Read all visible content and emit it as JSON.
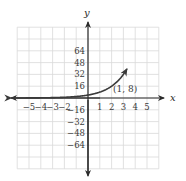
{
  "chart_data": {
    "type": "line",
    "title": "",
    "xlabel": "x",
    "ylabel": "y",
    "xlim": [
      -6,
      6
    ],
    "ylim": [
      -96,
      96
    ],
    "x_ticks": [
      -5,
      -4,
      -3,
      -2,
      1,
      2,
      3,
      4,
      5
    ],
    "x_tick_labels": [
      "−5",
      "−4",
      "−3",
      "−2",
      "1",
      "2",
      "3",
      "4",
      "5"
    ],
    "y_ticks": [
      64,
      48,
      32,
      16,
      -16,
      -32,
      -48,
      -64
    ],
    "y_tick_labels": [
      "64",
      "48",
      "32",
      "16",
      "−16",
      "−32",
      "−48",
      "−64"
    ],
    "grid": true,
    "grid_x_step": 1,
    "grid_y_step": 16,
    "series": [
      {
        "name": "y = 2^(x+2)",
        "x": [
          -6,
          -5,
          -4,
          -3,
          -2,
          -1,
          0,
          1,
          2,
          3,
          3.3
        ],
        "values": [
          0.0625,
          0.125,
          0.25,
          0.5,
          1,
          2,
          4,
          8,
          16,
          32,
          39.4
        ]
      }
    ],
    "annotations": [
      {
        "text": "(1, 8)",
        "x": 1,
        "y": 8
      }
    ],
    "arrows": {
      "left_end": true,
      "right_end": true
    }
  },
  "labels": {
    "x_axis": "x",
    "y_axis": "y",
    "point": "(1, 8)"
  }
}
